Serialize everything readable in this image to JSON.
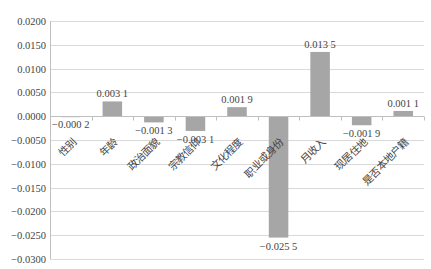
{
  "chart_data": {
    "type": "bar",
    "title": "",
    "xlabel": "",
    "ylabel": "",
    "categories": [
      "性别",
      "年龄",
      "政治面貌",
      "宗教信仰",
      "文化程度",
      "职业或身份",
      "月收入",
      "现居住地",
      "是否本地户籍"
    ],
    "values": [
      -0.0002,
      0.0031,
      -0.0013,
      -0.0031,
      0.0019,
      -0.0255,
      0.0135,
      -0.0019,
      0.0011
    ],
    "data_labels": [
      "−0.000 2",
      "0.003 1",
      "−0.001 3",
      "−0.003 1",
      "0.001 9",
      "−0.025 5",
      "0.013 5",
      "−0.001 9",
      "0.001 1"
    ],
    "ylim": [
      -0.03,
      0.02
    ],
    "y_ticks": [
      0.02,
      0.015,
      0.01,
      0.005,
      0.0,
      -0.005,
      -0.01,
      -0.015,
      -0.02,
      -0.025,
      -0.03
    ],
    "y_tick_labels": [
      "0.0200",
      "0.0150",
      "0.0100",
      "0.0050",
      "0.0000",
      "−0.0050",
      "−0.0100",
      "−0.0150",
      "−0.0200",
      "−0.0250",
      "−0.0300"
    ],
    "grid": true,
    "legend": null,
    "bar_color": "#a6a6a6",
    "grid_color": "#d9d9d9",
    "axis_color": "#bfbfbf"
  }
}
